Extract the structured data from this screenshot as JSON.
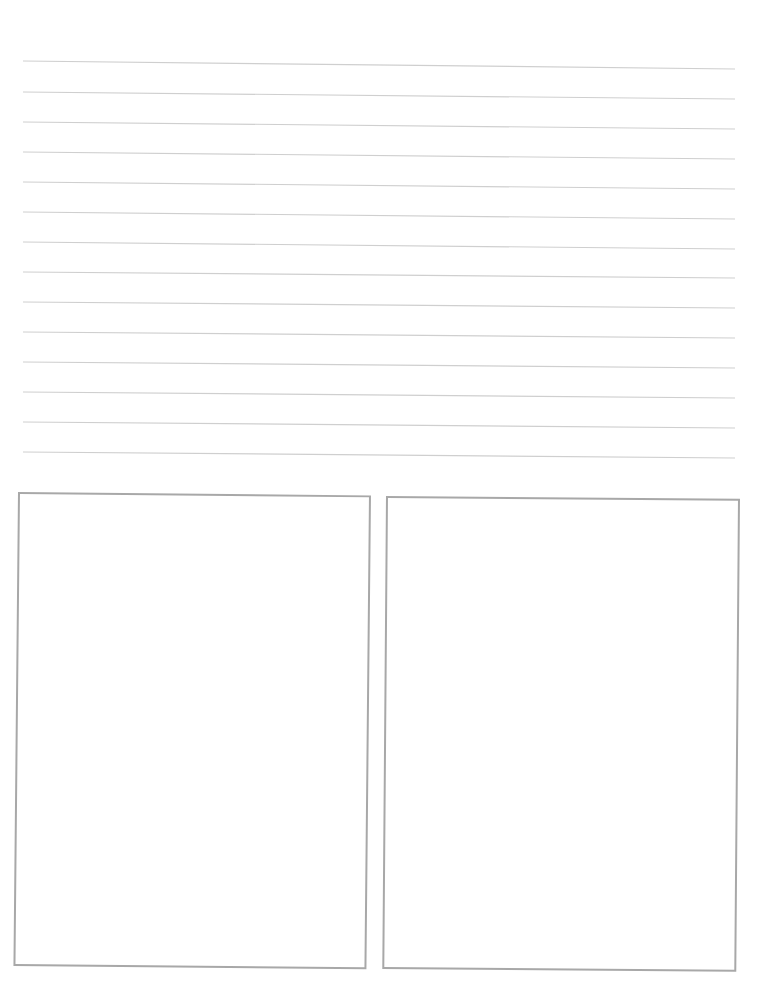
{
  "page": {
    "type": "lined-worksheet",
    "background_color": "#ffffff"
  },
  "ruled_lines": {
    "count": 14,
    "color": "#cfcfcf",
    "left_x": 23,
    "right_x": 735,
    "items": [
      {
        "y_left": 61,
        "y_right": 69
      },
      {
        "y_left": 92,
        "y_right": 99
      },
      {
        "y_left": 122,
        "y_right": 129
      },
      {
        "y_left": 152,
        "y_right": 159
      },
      {
        "y_left": 182,
        "y_right": 189
      },
      {
        "y_left": 212,
        "y_right": 219
      },
      {
        "y_left": 242,
        "y_right": 249
      },
      {
        "y_left": 272,
        "y_right": 278
      },
      {
        "y_left": 302,
        "y_right": 308
      },
      {
        "y_left": 332,
        "y_right": 338
      },
      {
        "y_left": 362,
        "y_right": 368
      },
      {
        "y_left": 392,
        "y_right": 398
      },
      {
        "y_left": 422,
        "y_right": 428
      },
      {
        "y_left": 452,
        "y_right": 458
      }
    ]
  },
  "boxes": {
    "border_color": "#a8a8a8",
    "left": {
      "label": ""
    },
    "right": {
      "label": ""
    }
  }
}
